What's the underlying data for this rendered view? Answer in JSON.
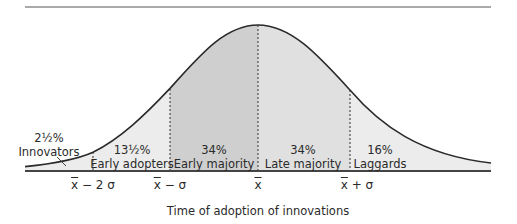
{
  "colors": {
    "curve": "#2a2a2a",
    "baseline": "#444444",
    "fill_tail": "#ececec",
    "fill_early_majority": "#cfcfcf",
    "fill_late_majority": "#e0e0e0"
  },
  "segments": [
    {
      "percent": "2½%",
      "label": "Innovators"
    },
    {
      "percent": "13½%",
      "label": "Early adopters"
    },
    {
      "percent": "34%",
      "label": "Early majority"
    },
    {
      "percent": "34%",
      "label": "Late majority"
    },
    {
      "percent": "16%",
      "label": "Laggards"
    }
  ],
  "ticks": [
    {
      "mean": "x",
      "rest": " − 2 σ"
    },
    {
      "mean": "x",
      "rest": " − σ"
    },
    {
      "mean": "x",
      "rest": ""
    },
    {
      "mean": "x",
      "rest": " + σ"
    }
  ],
  "axis_title": "Time of adoption of innovations"
}
